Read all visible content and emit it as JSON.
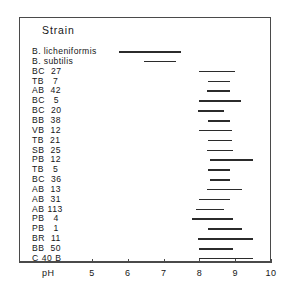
{
  "chart_data": {
    "type": "bar",
    "title": "Strain",
    "xlabel": "pH",
    "ylabel": "Strain",
    "xlim": [
      4.5,
      10
    ],
    "grid": false,
    "legend": null,
    "orientation": "horizontal",
    "bar_style": "range-interval",
    "axis": {
      "name": "pH",
      "ticks": [
        5,
        6,
        7,
        8,
        9,
        10
      ],
      "tick_labels": [
        "5",
        "6",
        "7",
        "8",
        "9",
        "10"
      ]
    },
    "categories": [
      "B. licheniformis",
      "B. subtilis",
      "BC  27",
      "TB   7",
      "AB  42",
      "BC   5",
      "BC  20",
      "BB  38",
      "VB  12",
      "TB  21",
      "SB  25",
      "PB  12",
      "TB   5",
      "BC  36",
      "AB  13",
      "AB  31",
      "AB 113",
      "PB   4",
      "PB   1",
      "BR  11",
      "BB  50",
      "C 40 B"
    ],
    "ranges": [
      [
        5.75,
        7.5
      ],
      [
        6.45,
        7.35
      ],
      [
        8.0,
        9.0
      ],
      [
        8.25,
        8.85
      ],
      [
        8.2,
        8.85
      ],
      [
        8.0,
        9.15
      ],
      [
        7.95,
        8.7
      ],
      [
        8.25,
        8.85
      ],
      [
        8.0,
        8.9
      ],
      [
        8.25,
        8.9
      ],
      [
        8.2,
        8.95
      ],
      [
        8.3,
        9.5
      ],
      [
        8.25,
        8.85
      ],
      [
        8.3,
        8.85
      ],
      [
        8.2,
        9.2
      ],
      [
        8.0,
        8.85
      ],
      [
        7.9,
        8.7
      ],
      [
        7.8,
        8.95
      ],
      [
        8.25,
        9.2
      ],
      [
        7.95,
        9.5
      ],
      [
        8.0,
        8.95
      ],
      [
        8.0,
        9.5
      ]
    ],
    "colors": {
      "bar": "#2b2b2b",
      "frame": "#4a4a4a",
      "text": "#161616",
      "background": "#ffffff"
    }
  },
  "layout": {
    "first_row_y": 46,
    "row_step": 9.85,
    "px_per_ph": 35.8,
    "ph_origin_x": 92,
    "ph_origin_value": 5
  }
}
